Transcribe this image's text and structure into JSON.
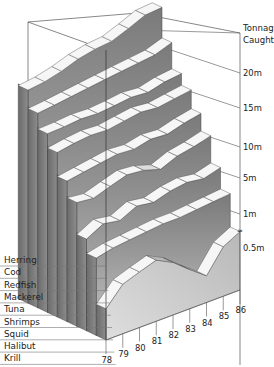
{
  "chart_data": {
    "type": "area",
    "subtype": "3d-layered-ribbon",
    "title": "",
    "ylabel": "Tonnage Caught",
    "xlabel": "",
    "y_ticks": [
      "0.5m",
      "1m",
      "5m",
      "10m",
      "15m",
      "20m"
    ],
    "y_axis_break": true,
    "categories": [
      "78",
      "79",
      "80",
      "81",
      "82",
      "83",
      "84",
      "85",
      "86"
    ],
    "series": [
      {
        "name": "Herring",
        "values": [
          13,
          13.5,
          14.5,
          16,
          17,
          17.5,
          19.5,
          22,
          22.5
        ]
      },
      {
        "name": "Cod",
        "values": [
          9.5,
          9.8,
          10.2,
          10.6,
          11,
          11.4,
          11.8,
          12.2,
          13.5
        ]
      },
      {
        "name": "Redfish",
        "values": [
          7.2,
          7.3,
          7.5,
          7.4,
          7.6,
          7.9,
          7.7,
          8.3,
          8.6
        ]
      },
      {
        "name": "Mackerel",
        "values": [
          5.6,
          5.9,
          6.1,
          6.0,
          6.3,
          6.6,
          6.4,
          6.7,
          7.0
        ]
      },
      {
        "name": "Tuna",
        "values": [
          3.6,
          3.8,
          4.0,
          4.2,
          4.1,
          4.4,
          4.3,
          4.7,
          5.0
        ]
      },
      {
        "name": "Shrimps",
        "values": [
          2.6,
          2.5,
          2.8,
          3.1,
          3.0,
          2.7,
          3.1,
          3.3,
          3.6
        ]
      },
      {
        "name": "Squid",
        "values": [
          1.3,
          1.6,
          1.5,
          1.8,
          1.7,
          1.9,
          2.0,
          1.9,
          2.1
        ]
      },
      {
        "name": "Halibut",
        "values": [
          0.9,
          1.0,
          1.05,
          1.1,
          1.15,
          1.15,
          1.2,
          1.25,
          1.3
        ]
      },
      {
        "name": "Krill",
        "values": [
          0.1,
          0.35,
          0.45,
          0.55,
          0.4,
          0.2,
          0.05,
          0.35,
          0.5
        ]
      }
    ],
    "legend_position": "left",
    "grid": false
  },
  "axis": {
    "title_line1": "Tonnage",
    "title_line2": "Caught",
    "tick_labels": [
      "20m",
      "15m",
      "10m",
      "5m",
      "1m",
      "0.5m"
    ]
  },
  "legend": {
    "items": [
      "Herring",
      "Cod",
      "Redfish",
      "Mackerel",
      "Tuna",
      "Shrimps",
      "Squid",
      "Halibut",
      "Krill"
    ]
  },
  "years": [
    "78",
    "79",
    "80",
    "81",
    "82",
    "83",
    "84",
    "85",
    "86"
  ],
  "colors": {
    "ribbon_top_light": "#f4f4f4",
    "ribbon_top_mid": "#d4d4d4",
    "side_dark": "#5e5e5e",
    "side_light": "#a9a9a9",
    "floor": "#cfcfcf",
    "line": "#333333"
  }
}
